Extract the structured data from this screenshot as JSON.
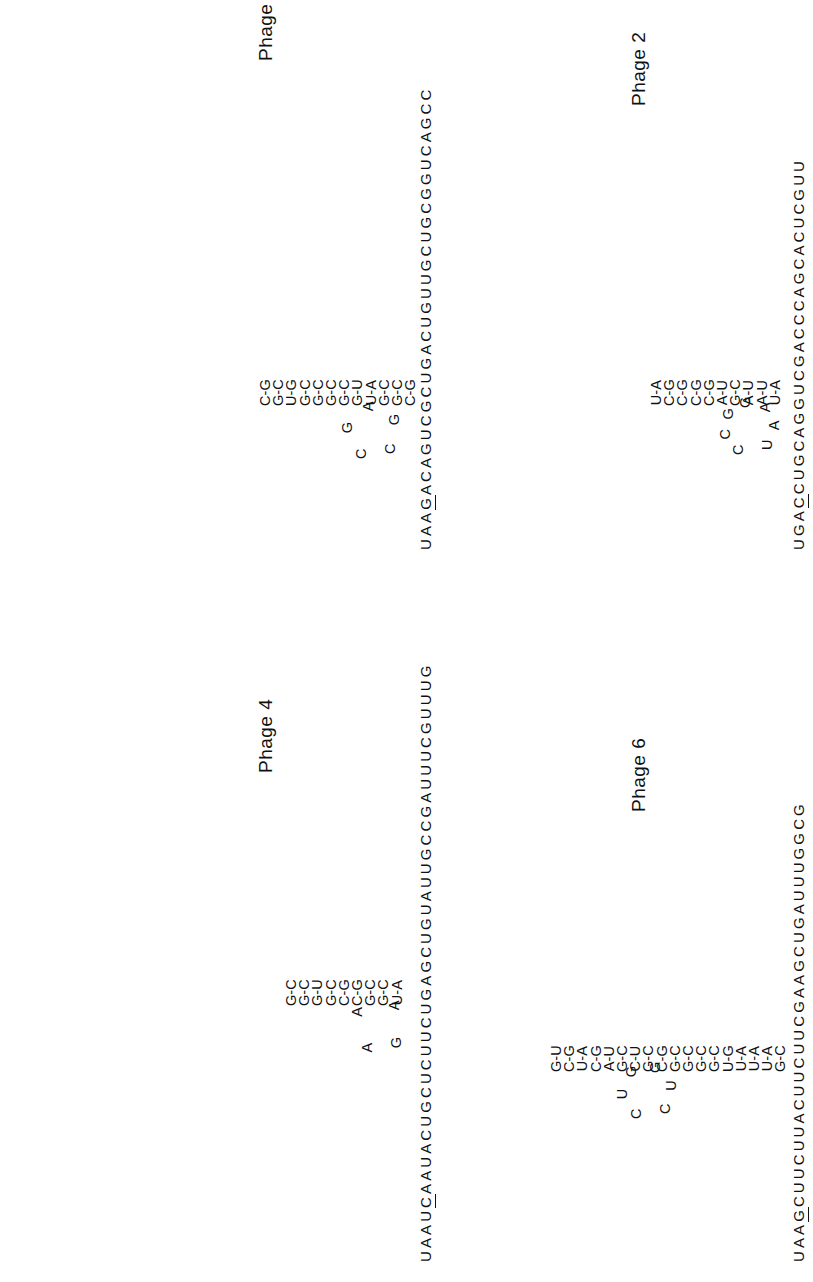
{
  "figure": {
    "type": "rna-secondary-structure-panels",
    "orientation": "rotated-90-ccw",
    "ink_color": "#111111",
    "background_color": "#ffffff"
  },
  "panels": [
    {
      "id": "phage-1",
      "label": "Phage 1",
      "backbone": "UAAGACAGUCGCUGACUGUUGCUGCGGUCAGCC",
      "underline_start_index": 3,
      "underline_length": 1,
      "stem_pairs": [
        {
          "left": "C",
          "right": "G",
          "bond": "-"
        },
        {
          "left": "G",
          "right": "C",
          "bond": "-"
        },
        {
          "left": "G",
          "right": "C",
          "bond": "-"
        },
        {
          "left": "U",
          "right": "A",
          "bond": "-"
        },
        {
          "left": "G",
          "right": "U",
          "bond": "-"
        },
        {
          "left": "G",
          "right": "C",
          "bond": "-"
        },
        {
          "left": "G",
          "right": "C",
          "bond": "-"
        },
        {
          "left": "G",
          "right": "C",
          "bond": "-"
        },
        {
          "left": "G",
          "right": "C",
          "bond": "-"
        },
        {
          "left": "U",
          "right": "G",
          "bond": "-"
        },
        {
          "left": "G",
          "right": "C",
          "bond": "-"
        },
        {
          "left": "C",
          "right": "G",
          "bond": "-"
        }
      ],
      "loop": [
        "C",
        "G",
        "A",
        "G",
        "C"
      ]
    },
    {
      "id": "phage-2",
      "label": "Phage 2",
      "backbone": "UGACCUGCAGGUCGACCCAGCACUCGUU",
      "underline_start_index": 3,
      "underline_length": 1,
      "stem_pairs": [
        {
          "left": "U",
          "right": "A",
          "bond": "-"
        },
        {
          "left": "A",
          "right": "U",
          "bond": "-"
        },
        {
          "left": "A",
          "right": "U",
          "bond": "-"
        },
        {
          "left": "G",
          "right": "C",
          "bond": "-"
        },
        {
          "left": "A",
          "right": "U",
          "bond": "-"
        },
        {
          "left": "C",
          "right": "G",
          "bond": "-"
        },
        {
          "left": "C",
          "right": "G",
          "bond": "-"
        },
        {
          "left": "C",
          "right": "G",
          "bond": "-"
        },
        {
          "left": "C",
          "right": "G",
          "bond": "-"
        },
        {
          "left": "U",
          "right": "A",
          "bond": "-"
        }
      ],
      "loop": [
        "C",
        "C",
        "G",
        "G",
        "A",
        "A",
        "U"
      ]
    },
    {
      "id": "phage-4",
      "label": "Phage 4",
      "backbone": "UAAUCAAUACUGCUCUUCUGAGCUGUAUUGCCGAUUUCGUUUG",
      "underline_start_index": 4,
      "underline_length": 1,
      "stem_pairs": [
        {
          "left": "U",
          "right": "A",
          "bond": "-"
        },
        {
          "left": "G",
          "right": "C",
          "bond": "-"
        },
        {
          "left": "G",
          "right": "C",
          "bond": "-"
        },
        {
          "left": "C",
          "right": "G",
          "bond": "-"
        },
        {
          "left": "C",
          "right": "G",
          "bond": "-"
        },
        {
          "left": "G",
          "right": "C",
          "bond": "-"
        },
        {
          "left": "G",
          "right": "U",
          "bond": "-"
        },
        {
          "left": "G",
          "right": "C",
          "bond": "-"
        },
        {
          "left": "G",
          "right": "C",
          "bond": "-"
        }
      ],
      "loop": [
        "A",
        "A",
        "A",
        "G"
      ]
    },
    {
      "id": "phage-6",
      "label": "Phage 6",
      "backbone": "UAAGCUUCUUACUUCUUCGAAGCUGAUUUGGCG",
      "underline_start_index": 3,
      "underline_length": 1,
      "stem_pairs": [
        {
          "left": "G",
          "right": "C",
          "bond": "-"
        },
        {
          "left": "U",
          "right": "A",
          "bond": "-"
        },
        {
          "left": "U",
          "right": "A",
          "bond": "-"
        },
        {
          "left": "U",
          "right": "A",
          "bond": "-"
        },
        {
          "left": "U",
          "right": "G",
          "bond": "-"
        },
        {
          "left": "G",
          "right": "C",
          "bond": "-"
        },
        {
          "left": "G",
          "right": "C",
          "bond": "-"
        },
        {
          "left": "G",
          "right": "C",
          "bond": "-"
        },
        {
          "left": "G",
          "right": "C",
          "bond": "-"
        },
        {
          "left": "C",
          "right": "G",
          "bond": "-"
        },
        {
          "left": "G",
          "right": "C",
          "bond": "-"
        },
        {
          "left": "C",
          "right": "U",
          "bond": "-"
        },
        {
          "left": "G",
          "right": "C",
          "bond": "-"
        },
        {
          "left": "A",
          "right": "U",
          "bond": "-"
        },
        {
          "left": "C",
          "right": "G",
          "bond": "-"
        },
        {
          "left": "U",
          "right": "A",
          "bond": "-"
        },
        {
          "left": "C",
          "right": "G",
          "bond": "-"
        },
        {
          "left": "G",
          "right": "U",
          "bond": "-"
        }
      ],
      "loop": [
        "C",
        "U",
        "G",
        "G",
        "U",
        "C"
      ]
    }
  ]
}
